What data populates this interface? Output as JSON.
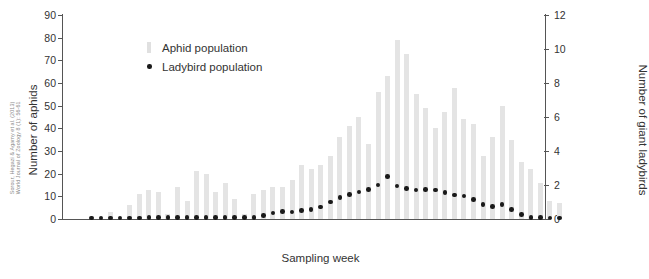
{
  "citation": {
    "line1": "Sorour, Hegazi & Agamy et al. (2013)",
    "line2": "World Journal of Zoology 8 (1): 56-61"
  },
  "axes": {
    "xlabel": "Sampling week",
    "ylabel_left": "Number of aphids",
    "ylabel_right": "Number of giant ladybirds",
    "left_ticks": [
      "0",
      "10",
      "20",
      "30",
      "40",
      "50",
      "60",
      "70",
      "80",
      "90"
    ],
    "right_ticks": [
      "0",
      "2",
      "4",
      "6",
      "8",
      "10",
      "12"
    ]
  },
  "legend": {
    "items": [
      {
        "label": "Aphid population",
        "marker": "bar-swatch",
        "color": "#e0e0e0"
      },
      {
        "label": "Ladybird population",
        "marker": "dot-swatch",
        "color": "#1a1a1a"
      }
    ]
  },
  "chart_data": {
    "type": "bar",
    "title": "",
    "xlabel": "Sampling week",
    "ylabel": "Number of aphids",
    "ylabel_secondary": "Number of giant ladybirds",
    "ylim": [
      0,
      90
    ],
    "ylim_secondary": [
      0,
      12
    ],
    "grid": false,
    "legend_position": "top-left",
    "categories": [
      1,
      2,
      3,
      4,
      5,
      6,
      7,
      8,
      9,
      10,
      11,
      12,
      13,
      14,
      15,
      16,
      17,
      18,
      19,
      20,
      21,
      22,
      23,
      24,
      25,
      26,
      27,
      28,
      29,
      30,
      31,
      32,
      33,
      34,
      35,
      36,
      37,
      38,
      39,
      40,
      41,
      42,
      43,
      44,
      45,
      46,
      47,
      48,
      49,
      50
    ],
    "series": [
      {
        "name": "Aphid population",
        "axis": "left",
        "type": "bar",
        "color": "#e4e4e4",
        "values": [
          0,
          0,
          3,
          0,
          6,
          11,
          13,
          12,
          2,
          14,
          8,
          21,
          20,
          12,
          16,
          9,
          2,
          11,
          13,
          14,
          14,
          17,
          24,
          22,
          24,
          28,
          36,
          41,
          45,
          33,
          56,
          63,
          79,
          73,
          55,
          49,
          40,
          47,
          58,
          44,
          42,
          28,
          36,
          50,
          35,
          25,
          22,
          16,
          8,
          7
        ]
      },
      {
        "name": "Ladybird population",
        "axis": "right",
        "type": "scatter",
        "color": "#1a1a1a",
        "values": [
          0.05,
          0.05,
          0.05,
          0.05,
          0.05,
          0.05,
          0.1,
          0.1,
          0.1,
          0.1,
          0.1,
          0.1,
          0.1,
          0.1,
          0.1,
          0.1,
          0.1,
          0.1,
          0.2,
          0.35,
          0.45,
          0.4,
          0.5,
          0.55,
          0.7,
          1.0,
          1.25,
          1.45,
          1.6,
          1.75,
          2.0,
          2.5,
          1.95,
          1.8,
          1.7,
          1.75,
          1.7,
          1.55,
          1.4,
          1.35,
          1.15,
          0.85,
          0.75,
          0.85,
          0.55,
          0.25,
          0.1,
          0.1,
          0.05,
          0.05
        ]
      }
    ]
  }
}
